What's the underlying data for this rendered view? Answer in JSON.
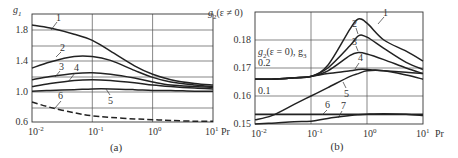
{
  "chart_data": [
    {
      "panel": "(a)",
      "type": "line",
      "title": "",
      "caption": "(a)",
      "xlabel": "Pr",
      "ylabel": "g1",
      "xscale": "log",
      "xlim": [
        0.01,
        10
      ],
      "ylim": [
        0.6,
        2.0
      ],
      "grid": true,
      "x_tick_labels": [
        "10^-2",
        "10^-1",
        "10^0",
        "10^1"
      ],
      "y_tick_labels": [
        "0.6",
        "1.0",
        "1.4",
        "1.8"
      ],
      "y_grid_values": [
        0.6,
        0.8,
        1.0,
        1.2,
        1.4,
        1.6,
        1.8,
        2.0
      ],
      "x": [
        0.01,
        0.02,
        0.05,
        0.1,
        0.2,
        0.5,
        1,
        2,
        5,
        10
      ],
      "series": [
        {
          "name": "1",
          "style": "solid",
          "values": [
            1.86,
            1.82,
            1.74,
            1.66,
            1.52,
            1.33,
            1.22,
            1.15,
            1.1,
            1.08
          ]
        },
        {
          "name": "2",
          "style": "solid",
          "values": [
            1.3,
            1.38,
            1.45,
            1.45,
            1.4,
            1.27,
            1.18,
            1.12,
            1.08,
            1.06
          ]
        },
        {
          "name": "3",
          "style": "solid",
          "values": [
            1.15,
            1.19,
            1.23,
            1.24,
            1.22,
            1.17,
            1.12,
            1.08,
            1.06,
            1.05
          ]
        },
        {
          "name": "4",
          "style": "solid",
          "values": [
            1.06,
            1.1,
            1.14,
            1.15,
            1.14,
            1.11,
            1.08,
            1.06,
            1.04,
            1.03
          ]
        },
        {
          "name": "5",
          "style": "solid",
          "values": [
            1.0,
            1.01,
            1.02,
            1.03,
            1.03,
            1.02,
            1.01,
            1.01,
            1.0,
            1.0
          ]
        },
        {
          "name": "6",
          "style": "dashed",
          "values": [
            0.86,
            0.79,
            0.72,
            0.68,
            0.66,
            0.64,
            0.63,
            0.62,
            0.61,
            0.61
          ]
        }
      ],
      "annotations": [
        {
          "text": "1",
          "at_pr": 0.03,
          "value": 1.78
        },
        {
          "text": "2",
          "at_pr": 0.03,
          "value": 1.4
        },
        {
          "text": "3",
          "at_pr": 0.025,
          "value": 1.2
        },
        {
          "text": "4",
          "at_pr": 0.04,
          "value": 1.13
        },
        {
          "text": "5",
          "at_pr": 0.15,
          "value": 1.03
        },
        {
          "text": "6",
          "at_pr": 0.03,
          "value": 0.76
        }
      ]
    },
    {
      "panel": "(b)",
      "type": "line",
      "title": "",
      "caption": "(b)",
      "xlabel": "Pr",
      "ylabel": "g2(ε ≠ 0)",
      "secondary_ylabel": "g2(ε = 0), g3",
      "secondary_ticks": [
        "0.2",
        "0.1"
      ],
      "xscale": "log",
      "xlim": [
        0.01,
        10
      ],
      "ylim": [
        0.15,
        0.19
      ],
      "grid": true,
      "x_tick_labels": [
        "10^-2",
        "10^-1",
        "10^0",
        "10^1"
      ],
      "y_tick_labels": [
        "0.15",
        "0.16",
        "0.17",
        "0.18"
      ],
      "y_grid_values": [
        0.15,
        0.16,
        0.17,
        0.18
      ],
      "x": [
        0.01,
        0.02,
        0.05,
        0.1,
        0.2,
        0.5,
        0.7,
        1,
        2,
        5,
        10
      ],
      "series": [
        {
          "name": "1",
          "values": [
            0.166,
            0.166,
            0.1665,
            0.167,
            0.171,
            0.184,
            0.1875,
            0.186,
            0.18,
            0.176,
            0.1725
          ]
        },
        {
          "name": "2",
          "values": [
            0.166,
            0.166,
            0.1665,
            0.167,
            0.17,
            0.178,
            0.1815,
            0.181,
            0.177,
            0.172,
            0.1695
          ]
        },
        {
          "name": "3",
          "values": [
            0.166,
            0.166,
            0.1665,
            0.167,
            0.169,
            0.1745,
            0.1755,
            0.175,
            0.173,
            0.17,
            0.168
          ]
        },
        {
          "name": "4",
          "values": [
            0.166,
            0.166,
            0.1665,
            0.167,
            0.168,
            0.169,
            0.1695,
            0.1695,
            0.169,
            0.1685,
            0.168
          ]
        },
        {
          "name": "5",
          "values": [
            0.1515,
            0.153,
            0.157,
            0.16,
            0.163,
            0.167,
            0.168,
            0.169,
            0.169,
            0.1675,
            0.166
          ]
        },
        {
          "name": "6",
          "values": [
            0.1535,
            0.1535,
            0.1535,
            0.1535,
            0.1535,
            0.1535,
            0.1535,
            0.1535,
            0.1535,
            0.1535,
            0.1535
          ]
        },
        {
          "name": "7",
          "values": [
            0.15,
            0.1503,
            0.1508,
            0.151,
            0.152,
            0.153,
            0.1533,
            0.1535,
            0.1537,
            0.1535,
            0.153
          ]
        }
      ],
      "annotations": [
        {
          "text": "1",
          "at_pr": 1.6,
          "value": 0.1885
        },
        {
          "text": "2",
          "at_pr": 0.55,
          "value": 0.1855
        },
        {
          "text": "3",
          "at_pr": 0.55,
          "value": 0.178
        },
        {
          "text": "4",
          "at_pr": 0.8,
          "value": 0.1715
        },
        {
          "text": "5",
          "at_pr": 0.4,
          "value": 0.1595
        },
        {
          "text": "6",
          "at_pr": 0.25,
          "value": 0.1555
        },
        {
          "text": "7",
          "at_pr": 0.45,
          "value": 0.1555
        }
      ]
    }
  ],
  "labels": {
    "a": {
      "ylabel_main": "g",
      "ylabel_sub": "1",
      "yticks": [
        "1.8",
        "1.4",
        "1.0",
        "0.6"
      ],
      "xticks_base": [
        "10",
        "10",
        "10",
        "10"
      ],
      "xticks_exp": [
        "-2",
        "-1",
        "0",
        "1"
      ],
      "xlabel": "Pr",
      "caption": "(a)",
      "curve_labels": [
        "1",
        "2",
        "3",
        "4",
        "5",
        "6"
      ]
    },
    "b": {
      "ylabel_main": "g",
      "ylabel_sub": "2",
      "ylabel_rest": "(ε ≠ 0)",
      "inner_label_main": "g",
      "inner_label_sub": "2",
      "inner_label_mid": "(ε = 0), g",
      "inner_label_sub2": "3",
      "inner_tick_02": "0.2",
      "inner_tick_01": "0.1",
      "yticks": [
        "0.18",
        "0.17",
        "0.16",
        "0.15"
      ],
      "xticks_base": [
        "10",
        "10",
        "10",
        "10"
      ],
      "xticks_exp": [
        "-2",
        "-1",
        "0",
        "1"
      ],
      "xlabel": "Pr",
      "caption": "(b)",
      "curve_labels": [
        "1",
        "2",
        "3",
        "4",
        "5",
        "6",
        "7"
      ]
    }
  }
}
